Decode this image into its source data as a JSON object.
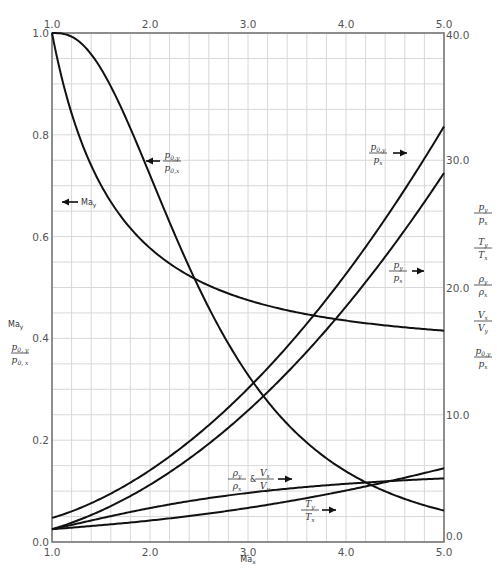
{
  "chart_data": {
    "type": "line",
    "title": "",
    "xlabel": "Ma_x",
    "ylabel_left": [
      "Ma_y",
      "p0,y / p0,x"
    ],
    "ylabel_right": [
      "p_y / p_x",
      "T_y / T_x",
      "ρ_y / ρ_x",
      "V_x / V_y",
      "p0,y / p_x"
    ],
    "xlim": [
      1.0,
      5.0
    ],
    "ylim_left": [
      0.0,
      1.0
    ],
    "ylim_right": [
      0.0,
      40.0
    ],
    "x_ticks_bottom": [
      "1.0",
      "2.0",
      "3.0",
      "4.0",
      "5.0"
    ],
    "x_ticks_top": [
      "1.0",
      "2.0",
      "3.0",
      "4.0",
      "5.0"
    ],
    "y_ticks_left": [
      "0.0",
      "0.2",
      "0.4",
      "0.6",
      "0.8",
      "1.0"
    ],
    "y_ticks_right": [
      "0.0",
      "10.0",
      "20.0",
      "30.0",
      "40.0"
    ],
    "grid": true,
    "gamma": 1.4,
    "series": [
      {
        "name": "Ma_y",
        "axis": "left",
        "x": [
          1.0,
          1.5,
          2.0,
          2.5,
          3.0,
          3.5,
          4.0,
          4.5,
          5.0
        ],
        "values": [
          1.0,
          0.701,
          0.577,
          0.513,
          0.475,
          0.451,
          0.435,
          0.424,
          0.415
        ]
      },
      {
        "name": "p0,y/p0,x",
        "axis": "left",
        "x": [
          1.0,
          1.5,
          2.0,
          2.5,
          3.0,
          3.5,
          4.0,
          4.5,
          5.0
        ],
        "values": [
          1.0,
          0.93,
          0.721,
          0.499,
          0.328,
          0.213,
          0.139,
          0.092,
          0.062
        ]
      },
      {
        "name": "p0,y/p_x",
        "axis": "right",
        "x": [
          1.0,
          1.5,
          2.0,
          2.5,
          3.0,
          3.5,
          4.0,
          4.5,
          5.0
        ],
        "values": [
          1.893,
          3.413,
          5.64,
          8.526,
          12.06,
          16.24,
          21.07,
          26.54,
          32.65
        ]
      },
      {
        "name": "p_y/p_x",
        "axis": "right",
        "x": [
          1.0,
          1.5,
          2.0,
          2.5,
          3.0,
          3.5,
          4.0,
          4.5,
          5.0
        ],
        "values": [
          1.0,
          2.458,
          4.5,
          7.125,
          10.333,
          14.125,
          18.5,
          23.458,
          29.0
        ]
      },
      {
        "name": "ρ_y/ρ_x & V_x/V_y",
        "axis": "right",
        "x": [
          1.0,
          1.5,
          2.0,
          2.5,
          3.0,
          3.5,
          4.0,
          4.5,
          5.0
        ],
        "values": [
          1.0,
          1.862,
          2.667,
          3.333,
          3.857,
          4.261,
          4.571,
          4.812,
          5.0
        ]
      },
      {
        "name": "T_y/T_x",
        "axis": "right",
        "x": [
          1.0,
          1.5,
          2.0,
          2.5,
          3.0,
          3.5,
          4.0,
          4.5,
          5.0
        ],
        "values": [
          1.0,
          1.32,
          1.688,
          2.138,
          2.679,
          3.315,
          4.047,
          4.875,
          5.8
        ]
      }
    ],
    "annotations": [
      {
        "text": "← Ma_y",
        "near": "left, y≈0.65"
      },
      {
        "text": "← p0,y/p0,x",
        "near": "Ma≈1.9, y≈0.8"
      },
      {
        "text": "p0,y/p_x →",
        "near": "Ma≈4.2, right≈30"
      },
      {
        "text": "p_y/p_x →",
        "near": "Ma≈4.4, right≈22"
      },
      {
        "text": "ρ_y/ρ_x & V_x/V_y →",
        "near": "Ma≈2.8, right≈5"
      },
      {
        "text": "T_y/T_x →",
        "near": "Ma≈3.7, right≈2"
      }
    ]
  },
  "labels": {
    "x_axis": "Ma",
    "x_axis_sub": "x",
    "left_may": "Ma",
    "left_may_sub": "y",
    "left_p0_num": "p",
    "left_p0_num_sub": "0, y",
    "left_p0_den": "p",
    "left_p0_den_sub": "0, x",
    "ann_may": "Ma",
    "ann_may_sub": "y",
    "amp": "&"
  }
}
